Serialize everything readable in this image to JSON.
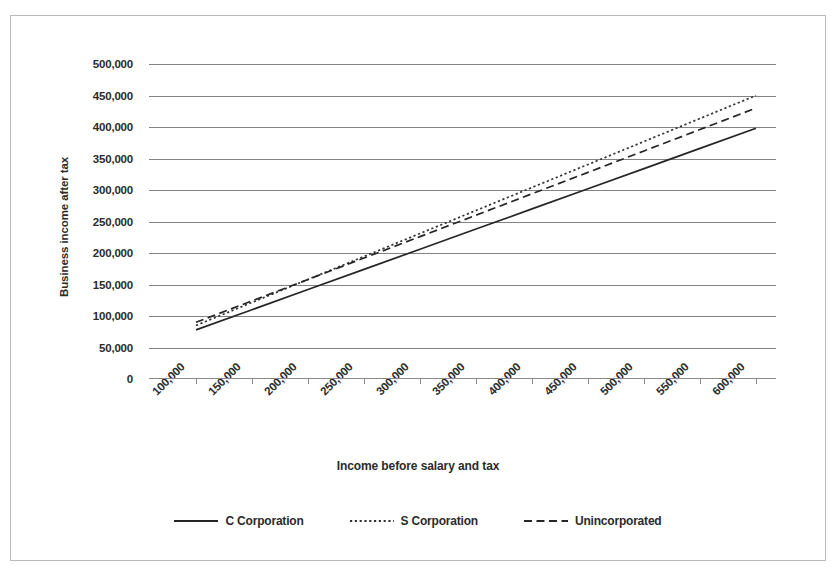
{
  "chart_data": {
    "type": "line",
    "title": "",
    "xlabel": "Income before salary and tax",
    "ylabel": "Business income after tax",
    "grid": true,
    "legend_position": "bottom",
    "ylim": [
      0,
      500000
    ],
    "yticks": [
      0,
      50000,
      100000,
      150000,
      200000,
      250000,
      300000,
      350000,
      400000,
      450000,
      500000
    ],
    "ytick_labels": [
      "0",
      "50,000",
      "100,000",
      "150,000",
      "200,000",
      "250,000",
      "300,000",
      "350,000",
      "400,000",
      "450,000",
      "500,000"
    ],
    "categories": [
      100000,
      150000,
      200000,
      250000,
      300000,
      350000,
      400000,
      450000,
      500000,
      550000,
      600000
    ],
    "xtick_labels": [
      "100,000",
      "150,000",
      "200,000",
      "250,000",
      "300,000",
      "350,000",
      "400,000",
      "450,000",
      "500,000",
      "550,000",
      "600,000"
    ],
    "series": [
      {
        "name": "C Corporation",
        "style": "solid",
        "color": "#262626",
        "values": [
          78000,
          110000,
          142000,
          174000,
          206000,
          238000,
          270000,
          302000,
          334000,
          366000,
          398000
        ]
      },
      {
        "name": "S Corporation",
        "style": "dotted",
        "color": "#333333",
        "values": [
          85000,
          121500,
          158000,
          194500,
          231000,
          267500,
          304000,
          340500,
          377000,
          413500,
          450000
        ]
      },
      {
        "name": "Unincorporated",
        "style": "dashed",
        "color": "#262626",
        "values": [
          90000,
          124000,
          158000,
          192000,
          226000,
          260000,
          294000,
          328000,
          362000,
          396000,
          430000
        ]
      }
    ]
  }
}
